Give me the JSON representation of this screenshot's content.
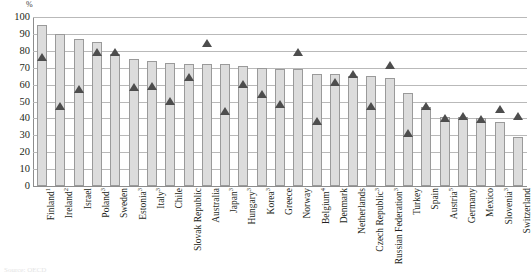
{
  "chart_data": {
    "type": "bar",
    "title": "",
    "subtitle": "",
    "xlabel": "",
    "ylabel": "%",
    "ylim": [
      0,
      100
    ],
    "ytick_step": 10,
    "yticks": [
      "100",
      "90",
      "80",
      "70",
      "60",
      "50",
      "40",
      "30",
      "20",
      "10",
      "0"
    ],
    "grid": true,
    "legend_position": "none",
    "bar_color": "#dcdcdc",
    "bar_border_color": "#9a9a9a",
    "marker_color": "#4d4d4d",
    "categories": [
      "Finland",
      "Ireland",
      "Israel",
      "Poland",
      "Sweden",
      "Estonia",
      "Italy",
      "Chile",
      "Slovak Republic",
      "Australia",
      "Japan",
      "Hungary",
      "Korea",
      "Greece",
      "Norway",
      "Belgium",
      "Denmark",
      "Netherlands",
      "Czech Republic",
      "Russian Federation",
      "Turkey",
      "Spain",
      "Austria",
      "Germany",
      "Mexico",
      "Slovenia",
      "Switzerland"
    ],
    "category_footnotes": [
      "1",
      "2",
      "",
      "3",
      "",
      "3",
      "3",
      "",
      "",
      "",
      "3",
      "3",
      "3",
      "",
      "",
      "4",
      "",
      "",
      "3",
      "3",
      "",
      "",
      "5",
      "",
      "",
      "3",
      ""
    ],
    "series": [
      {
        "name": "bars",
        "type": "bar",
        "values": [
          95,
          90,
          87,
          85,
          78,
          75,
          74,
          73,
          72,
          72,
          72,
          71,
          70,
          69,
          69,
          66,
          66,
          65,
          65,
          64,
          55,
          47,
          41,
          41,
          40,
          38,
          29
        ]
      },
      {
        "name": "markers",
        "type": "scatter",
        "values": [
          74,
          45,
          55,
          77,
          77,
          56,
          57,
          48,
          62,
          82,
          42,
          58,
          52,
          46,
          77,
          36,
          59,
          64,
          45,
          69,
          29,
          45,
          38,
          39,
          37,
          43,
          39
        ]
      }
    ]
  },
  "footnote_cropped": "Source: OECD"
}
